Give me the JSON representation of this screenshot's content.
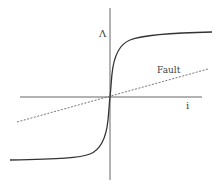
{
  "diagram": {
    "y_axis_label": "Λ",
    "x_axis_label": "i",
    "fault_label": "Fault",
    "colors": {
      "axes": "#555555",
      "curve": "#333333",
      "fault_line": "#666666",
      "background": "#ffffff"
    }
  }
}
